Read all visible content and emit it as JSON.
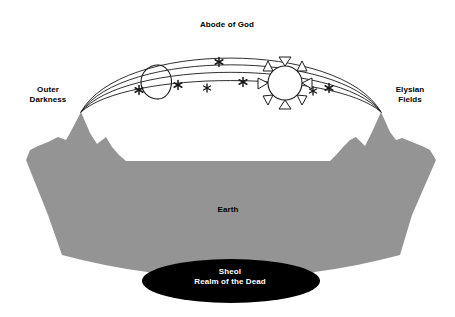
{
  "diagram": {
    "type": "cosmology-cross-section",
    "background_color": "#ffffff"
  },
  "labels": {
    "abode_of_god": "Abode of God",
    "outer_darkness": "Outer\nDarkness",
    "elysian_fields": "Elysian\nFields",
    "earth": "Earth",
    "sheol_line1": "Sheol",
    "sheol_line2": "Realm of the Dead",
    "sheol_full": "Sheol\nRealm of the Dead"
  },
  "colors": {
    "earth_gray": "#949494",
    "sheol_black": "#000000",
    "line_black": "#1a1a1a",
    "text_black": "#000000",
    "text_white": "#ffffff",
    "background": "#ffffff"
  },
  "celestial_bodies": {
    "sun": {
      "name": "sun",
      "cx": 285,
      "cy": 83,
      "radius": 17,
      "ray_count": 8,
      "fill": "#ffffff",
      "stroke": "#1a1a1a"
    },
    "moon": {
      "name": "moon-crescent",
      "cx": 152,
      "cy": 82,
      "radius": 17,
      "phase": "crescent",
      "opens": "right",
      "stroke": "#1a1a1a"
    },
    "stars": [
      {
        "cx": 139,
        "cy": 90,
        "size": 9
      },
      {
        "cx": 178,
        "cy": 85,
        "size": 9
      },
      {
        "cx": 207,
        "cy": 88,
        "size": 8
      },
      {
        "cx": 219,
        "cy": 62,
        "size": 9
      },
      {
        "cx": 243,
        "cy": 82,
        "size": 9
      },
      {
        "cx": 313,
        "cy": 91,
        "size": 8
      },
      {
        "cx": 329,
        "cy": 88,
        "size": 9
      }
    ],
    "star_count": 7
  },
  "firmament_arcs": {
    "count": 4,
    "description": "Four nested dome arcs spanning from the left mountain peak to the right mountain peak",
    "left_anchor": {
      "x": 81,
      "y": 112
    },
    "right_anchor": {
      "x": 381,
      "y": 112
    },
    "apex_heights": [
      40,
      47,
      55,
      63
    ],
    "stroke": "#1a1a1a",
    "stroke_width": 0.9
  },
  "earth": {
    "name": "earth-mass",
    "fill": "#949494",
    "shape": "trapezoid with curved bottom and twin mountain peaks on each side",
    "top_y": 112,
    "bottom_y": 262,
    "left_top_x": 26,
    "right_top_x": 436,
    "left_bottom_x": 62,
    "right_bottom_x": 400
  },
  "mountains": {
    "left": {
      "name": "left-mountain",
      "main_peak": {
        "x": 81,
        "y": 112
      },
      "secondary_peak": {
        "x": 106,
        "y": 137
      }
    },
    "right": {
      "name": "right-mountain",
      "main_peak": {
        "x": 381,
        "y": 112
      },
      "secondary_peak": {
        "x": 356,
        "y": 137
      }
    }
  },
  "sheol": {
    "name": "sheol-ellipse",
    "cx": 231,
    "cy": 281,
    "rx": 89,
    "ry": 22,
    "fill": "#000000",
    "text_color": "#ffffff"
  }
}
